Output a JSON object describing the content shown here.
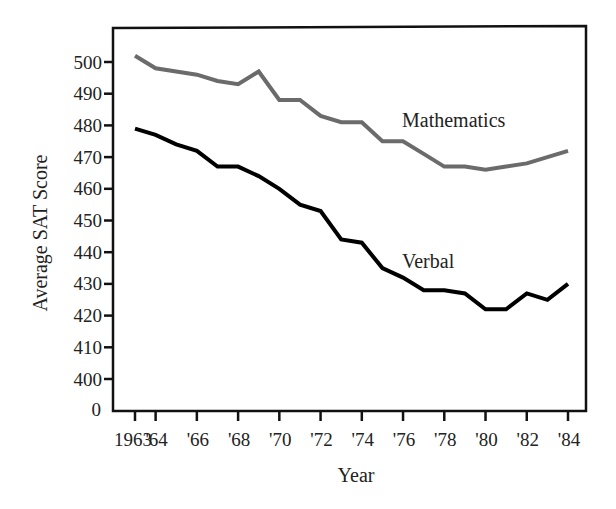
{
  "chart_data": {
    "type": "line",
    "title": "",
    "xlabel": "Year",
    "ylabel": "Average SAT Score",
    "x": [
      1963,
      1964,
      1965,
      1966,
      1967,
      1968,
      1969,
      1970,
      1971,
      1972,
      1973,
      1974,
      1975,
      1976,
      1977,
      1978,
      1979,
      1980,
      1981,
      1982,
      1983,
      1984
    ],
    "x_tick_labels": [
      "1963",
      "'64",
      "'66",
      "'68",
      "'70",
      "'72",
      "'74",
      "'76",
      "'78",
      "'80",
      "'82",
      "'84"
    ],
    "x_tick_values": [
      1963,
      1964,
      1966,
      1968,
      1970,
      1972,
      1974,
      1976,
      1978,
      1980,
      1982,
      1984
    ],
    "y_tick_labels": [
      "0",
      "400",
      "410",
      "420",
      "430",
      "440",
      "450",
      "460",
      "470",
      "480",
      "490",
      "500"
    ],
    "y_tick_values": [
      400,
      410,
      420,
      430,
      440,
      450,
      460,
      470,
      480,
      490,
      500
    ],
    "y_axis_break": true,
    "ylim": [
      390,
      508
    ],
    "xlim": [
      1962,
      1985
    ],
    "grid": false,
    "legend": "inline labels",
    "series": [
      {
        "name": "Mathematics",
        "color": "#6b6b6b",
        "values": [
          502,
          498,
          497,
          496,
          494,
          493,
          497,
          488,
          488,
          483,
          481,
          481,
          475,
          475,
          471,
          467,
          467,
          466,
          467,
          468,
          470,
          472
        ],
        "label_position": {
          "x": 402,
          "y": 127
        }
      },
      {
        "name": "Verbal",
        "color": "#000000",
        "values": [
          479,
          477,
          474,
          472,
          467,
          467,
          464,
          460,
          455,
          453,
          444,
          443,
          435,
          432,
          428,
          428,
          427,
          422,
          422,
          427,
          425,
          430
        ],
        "label_position": {
          "x": 402,
          "y": 268
        }
      }
    ]
  },
  "labels": {
    "ylabel": "Average SAT Score",
    "xlabel": "Year",
    "math": "Mathematics",
    "verbal": "Verbal"
  }
}
